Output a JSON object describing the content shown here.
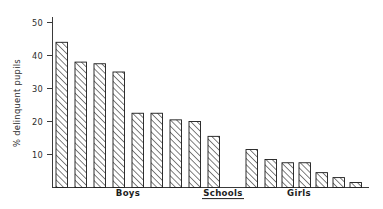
{
  "chart_data": {
    "type": "bar",
    "title": "",
    "subtitle": "",
    "xlabel": "Schools",
    "ylabel": "% delinquent pupils",
    "ylim": [
      0,
      52
    ],
    "yticks": [
      10,
      20,
      30,
      40,
      50
    ],
    "ytick_labels": [
      "10",
      "20",
      "30",
      "40",
      "50"
    ],
    "grid": false,
    "legend": false,
    "legend_position": "none",
    "bar_fill": "diagonal-hatch",
    "bar_edge_color": "#1a1a1a",
    "axis_color": "#3a3a3a",
    "background_color": "#ffffff",
    "categories": [
      "B1",
      "B2",
      "B3",
      "B4",
      "B5",
      "B6",
      "B7",
      "B8",
      "B9",
      "G1",
      "G2",
      "G3",
      "G4",
      "G5",
      "G6",
      "G7"
    ],
    "values": [
      44,
      38,
      37.5,
      35,
      22.5,
      22.5,
      20.5,
      20,
      15.5,
      11.5,
      8.5,
      7.5,
      7.5,
      4.5,
      3,
      1.5
    ],
    "group_annotations": [
      {
        "label": "Boys",
        "underline": false
      },
      {
        "label": "Schools",
        "underline": true
      },
      {
        "label": "Girls",
        "underline": false
      }
    ]
  },
  "axis": {
    "y_title": "% delinquent pupils",
    "y_tick_0": "10",
    "y_tick_1": "20",
    "y_tick_2": "30",
    "y_tick_3": "40",
    "y_tick_4": "50"
  },
  "labels": {
    "boys": "Boys",
    "schools": "Schools",
    "girls": "Girls"
  }
}
